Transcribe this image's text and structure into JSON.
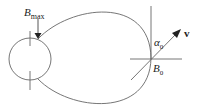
{
  "diagram": {
    "labels": {
      "bmax_main": "B",
      "bmax_sub": "max",
      "b0_main": "B",
      "b0_sub": "0",
      "alpha_main": "α",
      "alpha_sub": "0",
      "velocity": "v"
    },
    "colors": {
      "stroke": "#555555",
      "text": "#222222",
      "background": "#ffffff"
    }
  }
}
